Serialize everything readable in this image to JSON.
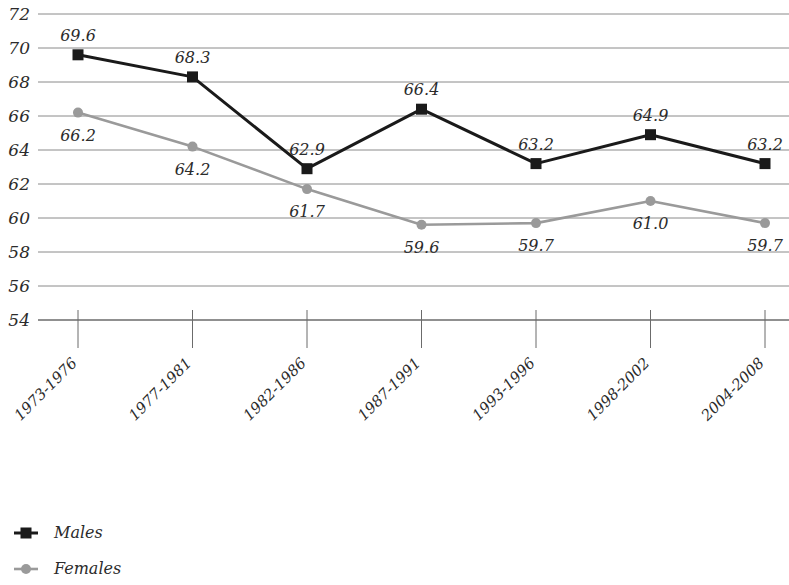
{
  "chart_data": {
    "type": "line",
    "title": "",
    "subtitle": "",
    "xlabel": "",
    "ylabel": "",
    "categories": [
      "1973-1976",
      "1977-1981",
      "1982-1986",
      "1987-1991",
      "1993-1996",
      "1998-2002",
      "2004-2008"
    ],
    "ylim": [
      54,
      72
    ],
    "ytick_step": 2,
    "yticks": [
      72,
      70,
      68,
      66,
      64,
      62,
      60,
      58,
      56,
      54
    ],
    "grid": true,
    "legend_position": "bottom-left",
    "series": [
      {
        "name": "Males",
        "color": "#1a1a1a",
        "marker": "square",
        "values": [
          69.6,
          68.3,
          62.9,
          66.4,
          63.2,
          64.9,
          63.2
        ],
        "labels": [
          "69.6",
          "68.3",
          "62.9",
          "66.4",
          "63.2",
          "64.9",
          "63.2"
        ],
        "label_positions": [
          "above",
          "above",
          "above",
          "above",
          "above",
          "above",
          "above"
        ]
      },
      {
        "name": "Females",
        "color": "#9a9a9a",
        "marker": "circle",
        "values": [
          66.2,
          64.2,
          61.7,
          59.6,
          59.7,
          61.0,
          59.7
        ],
        "labels": [
          "66.2",
          "64.2",
          "61.7",
          "59.6",
          "59.7",
          "61.0",
          "59.7"
        ],
        "label_positions": [
          "below",
          "below",
          "below",
          "below",
          "below",
          "below",
          "below"
        ]
      }
    ]
  },
  "legend": {
    "items": [
      {
        "label": "Males",
        "color": "#1a1a1a",
        "marker": "square"
      },
      {
        "label": "Females",
        "color": "#9a9a9a",
        "marker": "circle"
      }
    ]
  },
  "axis": {
    "gridline_color": "#8a8a8a",
    "baseline_color": "#6b6b6b",
    "tick_color": "#6b6b6b"
  }
}
